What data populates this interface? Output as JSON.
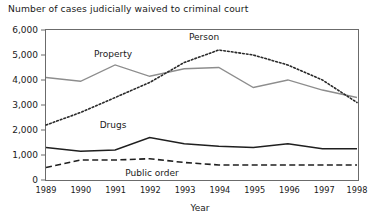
{
  "chart_data": {
    "type": "line",
    "title": "Number of cases judicially waived to criminal court",
    "xlabel": "Year",
    "ylabel": "",
    "grid": false,
    "legend_position": "inline-annotations",
    "categories": [
      "1989",
      "1990",
      "1991",
      "1992",
      "1993",
      "1994",
      "1995",
      "1996",
      "1997",
      "1998"
    ],
    "x": [
      1989,
      1990,
      1991,
      1992,
      1993,
      1994,
      1995,
      1996,
      1997,
      1998
    ],
    "xlim": [
      1989,
      1998
    ],
    "ylim": [
      0,
      6000
    ],
    "yticks": [
      "0",
      "1,000",
      "2,000",
      "3,000",
      "4,000",
      "5,000",
      "6,000"
    ],
    "ytick_values": [
      0,
      1000,
      2000,
      3000,
      4000,
      5000,
      6000
    ],
    "series": [
      {
        "name": "Person",
        "style": "dotted",
        "color": "#2a2a2a",
        "values": [
          2200,
          2700,
          3300,
          3900,
          4700,
          5200,
          5000,
          4600,
          4000,
          3100
        ]
      },
      {
        "name": "Property",
        "style": "solid",
        "color": "#8d8d8d",
        "values": [
          4100,
          3950,
          4600,
          4150,
          4450,
          4500,
          3700,
          4000,
          3600,
          3300
        ]
      },
      {
        "name": "Drugs",
        "style": "solid",
        "color": "#1f1f1f",
        "values": [
          1300,
          1150,
          1200,
          1700,
          1450,
          1350,
          1300,
          1450,
          1250,
          1250
        ]
      },
      {
        "name": "Public order",
        "style": "dashed",
        "color": "#1f1f1f",
        "values": [
          500,
          800,
          800,
          850,
          700,
          600,
          600,
          600,
          600,
          600
        ]
      }
    ],
    "annotations": [
      {
        "text": "Person",
        "x": 1994,
        "y": 5800
      },
      {
        "text": "Property",
        "x": 1991,
        "y": 5150
      },
      {
        "text": "Drugs",
        "x": 1991,
        "y": 2300
      },
      {
        "text": "Public order",
        "x": 1992.2,
        "y": 200
      }
    ]
  }
}
